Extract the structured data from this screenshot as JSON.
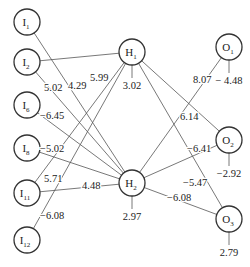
{
  "diagram": {
    "type": "neural-network",
    "nodes": {
      "inputs": [
        {
          "id": "I1",
          "base": "I",
          "sub": "1",
          "x": 27,
          "y": 22
        },
        {
          "id": "I2",
          "base": "I",
          "sub": "2",
          "x": 27,
          "y": 62
        },
        {
          "id": "I6",
          "base": "I",
          "sub": "6",
          "x": 27,
          "y": 105
        },
        {
          "id": "I8",
          "base": "I",
          "sub": "8",
          "x": 27,
          "y": 148
        },
        {
          "id": "I11",
          "base": "I",
          "sub": "11",
          "x": 27,
          "y": 193
        },
        {
          "id": "I12",
          "base": "I",
          "sub": "12",
          "x": 27,
          "y": 240
        }
      ],
      "hidden": [
        {
          "id": "H1",
          "base": "H",
          "sub": "1",
          "x": 132,
          "y": 52,
          "bias": "3.02"
        },
        {
          "id": "H2",
          "base": "H",
          "sub": "2",
          "x": 132,
          "y": 183,
          "bias": "2.97"
        }
      ],
      "outputs": [
        {
          "id": "O1",
          "base": "O",
          "sub": "1",
          "x": 229,
          "y": 47,
          "bias": "− 4.48"
        },
        {
          "id": "O2",
          "base": "O",
          "sub": "2",
          "x": 229,
          "y": 140,
          "bias": "−2.92"
        },
        {
          "id": "O3",
          "base": "O",
          "sub": "3",
          "x": 229,
          "y": 219,
          "bias": "2.79"
        }
      ]
    },
    "edges": [
      {
        "from": "I1",
        "to": "H2",
        "weight": "4.29",
        "lx": 68,
        "ly": 89
      },
      {
        "from": "I2",
        "to": "H1",
        "weight": "5.99",
        "lx": 90,
        "ly": 81
      },
      {
        "from": "I2",
        "to": "H2",
        "weight": "5.02",
        "lx": 44,
        "ly": 91
      },
      {
        "from": "I6",
        "to": "H2",
        "weight": "−6.45",
        "lx": 40,
        "ly": 119
      },
      {
        "from": "I8",
        "to": "H2",
        "weight": "−5.02",
        "lx": 40,
        "ly": 152
      },
      {
        "from": "I11",
        "to": "H1",
        "weight": "5.71",
        "lx": 44,
        "ly": 182
      },
      {
        "from": "I11",
        "to": "H2",
        "weight": "4.48",
        "lx": 82,
        "ly": 189
      },
      {
        "from": "I12",
        "to": "H1",
        "weight": "−6.08",
        "lx": 40,
        "ly": 219
      },
      {
        "from": "H1",
        "to": "O2",
        "weight": "6.14",
        "lx": 180,
        "ly": 120
      },
      {
        "from": "H1",
        "to": "O3",
        "weight": "−5.47",
        "lx": 183,
        "ly": 186
      },
      {
        "from": "H2",
        "to": "O1",
        "weight": "8.07",
        "lx": 193,
        "ly": 83
      },
      {
        "from": "H2",
        "to": "O2",
        "weight": "−6.41",
        "lx": 187,
        "ly": 152
      },
      {
        "from": "H2",
        "to": "O3",
        "weight": "−6.08",
        "lx": 167,
        "ly": 201
      }
    ]
  }
}
